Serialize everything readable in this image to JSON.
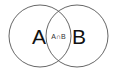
{
  "diagram": {
    "type": "venn",
    "sets": [
      {
        "id": "A",
        "label": "A",
        "cx": 40,
        "cy": 36,
        "r": 31
      },
      {
        "id": "B",
        "label": "B",
        "cx": 77,
        "cy": 36,
        "r": 31
      }
    ],
    "intersection": {
      "label": "A∩B",
      "x": 58,
      "y": 36
    },
    "colors": {
      "stroke": "#555555",
      "text": "#111111",
      "background": "#ffffff"
    }
  }
}
